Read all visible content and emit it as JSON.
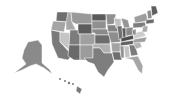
{
  "map": {
    "title": "",
    "type": "choropleth",
    "region": "United States",
    "color_scale": [
      "#5a5a5a",
      "#747474",
      "#8c8c8c",
      "#a4a4a4",
      "#c4c4c4"
    ],
    "states": [
      {
        "id": "WA",
        "shade": "#6e6e6e",
        "points": "57,12 68,12 68,22 56,21"
      },
      {
        "id": "OR",
        "shade": "#a4a4a4",
        "points": "53,21 66,22 64,32 51,30"
      },
      {
        "id": "CA",
        "shade": "#7a7a7a",
        "points": "51,30 60,32 60,42 72,55 68,60 58,58 52,44"
      },
      {
        "id": "ID",
        "shade": "#a8a8a8",
        "points": "68,12 71,12 72,22 76,30 66,30 66,22"
      },
      {
        "id": "NV",
        "shade": "#c4c4c4",
        "points": "60,32 70,33 69,50 60,42"
      },
      {
        "id": "MT",
        "shade": "#9a9a9a",
        "points": "71,12 92,14 92,24 76,24 72,22"
      },
      {
        "id": "WY",
        "shade": "#5c5c5c",
        "points": "78,24 92,24 92,34 78,34"
      },
      {
        "id": "UT",
        "shade": "#7c7c7c",
        "points": "70,30 78,30 78,34 80,34 80,45 69,45"
      },
      {
        "id": "AZ",
        "shade": "#6a6a6a",
        "points": "69,45 80,45 80,60 74,60 68,56"
      },
      {
        "id": "CO",
        "shade": "#a0a0a0",
        "points": "80,34 95,34 95,45 80,45"
      },
      {
        "id": "NM",
        "shade": "#9c9c9c",
        "points": "80,45 93,45 93,60 80,60"
      },
      {
        "id": "ND",
        "shade": "#5a5a5a",
        "points": "92,14 106,14 106,21 92,21"
      },
      {
        "id": "SD",
        "shade": "#909090",
        "points": "92,21 106,21 106,29 92,29"
      },
      {
        "id": "NE",
        "shade": "#8a8a8a",
        "points": "92,29 107,29 109,35 95,35 95,33 92,33"
      },
      {
        "id": "KS",
        "shade": "#6c6c6c",
        "points": "95,35 110,35 110,44 95,44"
      },
      {
        "id": "OK",
        "shade": "#b0b0b0",
        "points": "93,44 110,44 111,53 104,53 100,48 93,48"
      },
      {
        "id": "TX",
        "shade": "#7e7e7e",
        "points": "93,48 100,48 104,53 112,53 114,62 108,70 104,77 98,72 94,64 88,62 84,58 93,58"
      },
      {
        "id": "MN",
        "shade": "#909090",
        "points": "106,14 116,14 114,24 107,25"
      },
      {
        "id": "IA",
        "shade": "#848484",
        "points": "107,25 117,25 118,32 108,32"
      },
      {
        "id": "MO",
        "shade": "#8e8e8e",
        "points": "108,32 118,32 121,42 111,43"
      },
      {
        "id": "AR",
        "shade": "#a2a2a2",
        "points": "111,43 121,43 120,52 112,52"
      },
      {
        "id": "LA",
        "shade": "#6e6e6e",
        "points": "112,52 120,52 122,60 114,60"
      },
      {
        "id": "WI",
        "shade": "#c0c0c0",
        "points": "114,18 121,19 121,28 116,28"
      },
      {
        "id": "IL",
        "shade": "#707070",
        "points": "117,26 122,26 123,38 119,40 118,32"
      },
      {
        "id": "MI",
        "shade": "#969696",
        "points": "121,18 128,20 130,28 124,28"
      },
      {
        "id": "IN",
        "shade": "#5c5c5c",
        "points": "122,28 126,28 126,37 123,38"
      },
      {
        "id": "OH",
        "shade": "#8a8a8a",
        "points": "126,28 133,27 133,35 126,36"
      },
      {
        "id": "KY",
        "shade": "#4e4e4e",
        "points": "121,38 133,35 134,39 121,42"
      },
      {
        "id": "TN",
        "shade": "#626262",
        "points": "121,42 136,40 136,44 120,46"
      },
      {
        "id": "MS",
        "shade": "#929292",
        "points": "120,46 124,46 124,58 121,58"
      },
      {
        "id": "AL",
        "shade": "#c2c2c2",
        "points": "124,46 129,46 130,57 125,58"
      },
      {
        "id": "GA",
        "shade": "#7a7a7a",
        "points": "129,45 135,45 138,55 131,56"
      },
      {
        "id": "FL",
        "shade": "#a6a6a6",
        "points": "125,58 138,56 143,66 142,74 138,70 133,60"
      },
      {
        "id": "SC",
        "shade": "#b4b4b4",
        "points": "133,43 140,42 142,47 136,49"
      },
      {
        "id": "NC",
        "shade": "#a0a0a0",
        "points": "134,39 147,37 145,42 133,43"
      },
      {
        "id": "VA",
        "shade": "#cccccc",
        "points": "133,33 143,31 146,36 134,39"
      },
      {
        "id": "WV",
        "shade": "#8e8e8e",
        "points": "132,30 136,29 136,35 133,35"
      },
      {
        "id": "PA",
        "shade": "#7c7c7c",
        "points": "133,23 145,22 146,27 133,28"
      },
      {
        "id": "NY",
        "shade": "#9e9e9e",
        "points": "134,17 146,13 148,21 135,23"
      },
      {
        "id": "ME",
        "shade": "#5e5e5e",
        "points": "151,6 156,6 158,13 152,16"
      },
      {
        "id": "NH_VT",
        "shade": "#8c8c8c",
        "points": "147,11 151,10 152,18 148,19"
      },
      {
        "id": "MA_CT_RI",
        "shade": "#6a6a6a",
        "points": "146,20 154,19 154,23 146,24"
      },
      {
        "id": "NJ_DE_MD",
        "shade": "#aaaaaa",
        "points": "143,26 148,26 147,32 142,32"
      },
      {
        "id": "AK",
        "shade": "#8a8a8a",
        "points": "28,42 38,40 42,45 42,63 50,70 52,74 44,68 36,64 30,66 22,70 14,73 26,64 22,58 24,50"
      },
      {
        "id": "HI",
        "shade": "#7a7a7a",
        "points": "77,86 82,89 80,94 76,91"
      }
    ],
    "islands": [
      {
        "id": "HI-1",
        "cx": 60,
        "cy": 79,
        "r": 1
      },
      {
        "id": "HI-2",
        "cx": 65,
        "cy": 81,
        "r": 1
      },
      {
        "id": "HI-3",
        "cx": 69,
        "cy": 83,
        "r": 1.2
      },
      {
        "id": "HI-4",
        "cx": 73,
        "cy": 84,
        "r": 1
      }
    ]
  }
}
